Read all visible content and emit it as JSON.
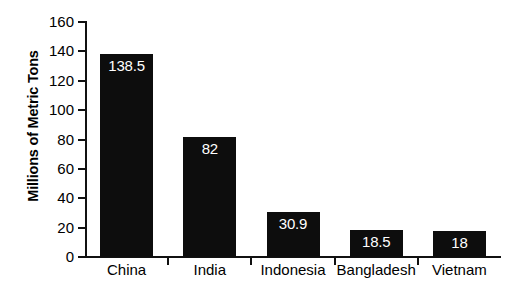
{
  "chart_data": {
    "type": "bar",
    "title": "",
    "xlabel": "",
    "ylabel": "Millions of Metric Tons",
    "categories": [
      "China",
      "India",
      "Indonesia",
      "Bangladesh",
      "Vietnam"
    ],
    "values": [
      138.5,
      82,
      30.9,
      18.5,
      18
    ],
    "value_labels": [
      "138.5",
      "82",
      "30.9",
      "18.5",
      "18"
    ],
    "ylim": [
      0,
      160
    ],
    "ytick_labels": [
      "0",
      "20",
      "40",
      "60",
      "80",
      "100",
      "120",
      "140",
      "160"
    ],
    "ytick_values": [
      0,
      20,
      40,
      60,
      80,
      100,
      120,
      140,
      160
    ],
    "grid": false,
    "legend": false,
    "bar_color": "#0d0d0d",
    "value_label_color": "#ffffff",
    "axis_color": "#111111",
    "background_color": "#ffffff"
  }
}
